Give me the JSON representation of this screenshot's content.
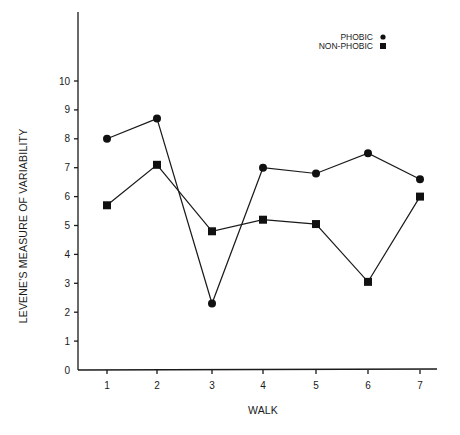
{
  "chart_data": {
    "type": "line",
    "title": "",
    "xlabel": "WALK",
    "ylabel": "LEVENE'S MEASURE OF VARIABILITY",
    "categories": [
      "1",
      "2",
      "3",
      "4",
      "5",
      "6",
      "7"
    ],
    "x": [
      1,
      2,
      3,
      4,
      5,
      6,
      7
    ],
    "yticks": [
      0,
      1,
      2,
      3,
      4,
      5,
      6,
      7,
      8,
      9,
      10
    ],
    "ylim": [
      0,
      10
    ],
    "grid": false,
    "legend_position": "top-right",
    "series": [
      {
        "name": "PHOBIC",
        "marker": "circle",
        "values": [
          8.0,
          8.7,
          2.3,
          7.0,
          6.8,
          7.5,
          6.6
        ]
      },
      {
        "name": "NON-PHOBIC",
        "marker": "square",
        "values": [
          5.7,
          7.1,
          4.8,
          5.2,
          5.05,
          3.05,
          6.0
        ]
      }
    ]
  },
  "legend": {
    "items": [
      {
        "label": "PHOBIC",
        "marker": "circle"
      },
      {
        "label": "NON-PHOBIC",
        "marker": "square"
      }
    ]
  },
  "colors": {
    "ink": "#1a1a1a",
    "background": "#ffffff"
  }
}
